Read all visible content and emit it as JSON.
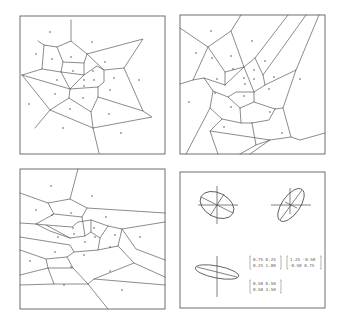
{
  "figure": {
    "panels": [
      {
        "id": "top-left",
        "type": "voronoi-diagram",
        "metric": "Euclidean"
      },
      {
        "id": "top-right",
        "type": "voronoi-diagram"
      },
      {
        "id": "bottom-left",
        "type": "voronoi-diagram"
      },
      {
        "id": "bottom-right",
        "type": "metric-ellipses"
      }
    ]
  },
  "matrices": {
    "m1": {
      "row1": "0.75 0.25",
      "row2": "0.25 1.00"
    },
    "m2": {
      "row1": "1.25 -0.50",
      "row2": "-0.50 0.75"
    },
    "m3": {
      "row1": "0.50 0.50",
      "row2": "0.50 3.50"
    }
  },
  "colors": {
    "line": "#5a5a5a",
    "frame": "#6e6e6e",
    "background": "#ffffff"
  }
}
